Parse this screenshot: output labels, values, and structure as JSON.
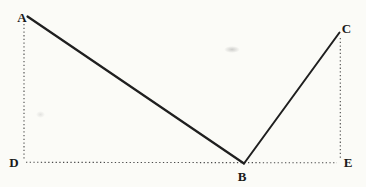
{
  "figure": {
    "width": 366,
    "height": 187,
    "background_color": "#fbfbf7",
    "solid_line_color": "#1f1f1f",
    "dotted_line_color": "#4a4a4a",
    "label_color": "#1a1a1a",
    "points": {
      "A": {
        "x": 27.5,
        "y": 16.5
      },
      "B": {
        "x": 244,
        "y": 163.5
      },
      "C": {
        "x": 339.5,
        "y": 32.5
      },
      "D": {
        "x": 24,
        "y": 162.3
      },
      "E": {
        "x": 340.3,
        "y": 162.5
      }
    },
    "labels": [
      {
        "id": "A",
        "text": "A",
        "x": 22,
        "y": 22
      },
      {
        "id": "B",
        "text": "B",
        "x": 242,
        "y": 180.5
      },
      {
        "id": "C",
        "text": "C",
        "x": 346.5,
        "y": 33
      },
      {
        "id": "D",
        "text": "D",
        "x": 14,
        "y": 167
      },
      {
        "id": "E",
        "text": "E",
        "x": 348,
        "y": 167
      }
    ],
    "solid_segments": [
      {
        "name": "segment-ab",
        "from": "A",
        "to": "B",
        "width": 2.2
      },
      {
        "name": "segment-bc",
        "from": "B",
        "to": "C",
        "width": 2.0
      }
    ],
    "dotted_segments": [
      {
        "name": "segment-ad-dotted",
        "x1": 24,
        "y1": 24,
        "x2": 24,
        "y2": 160
      },
      {
        "name": "segment-de-dotted",
        "x1": 26,
        "y1": 162.3,
        "x2": 337,
        "y2": 162.8
      },
      {
        "name": "segment-ce-dotted",
        "x1": 340.3,
        "y1": 38,
        "x2": 340.3,
        "y2": 159
      }
    ],
    "dash_pattern": "1.3 2.4",
    "dotted_width": 1.1
  }
}
